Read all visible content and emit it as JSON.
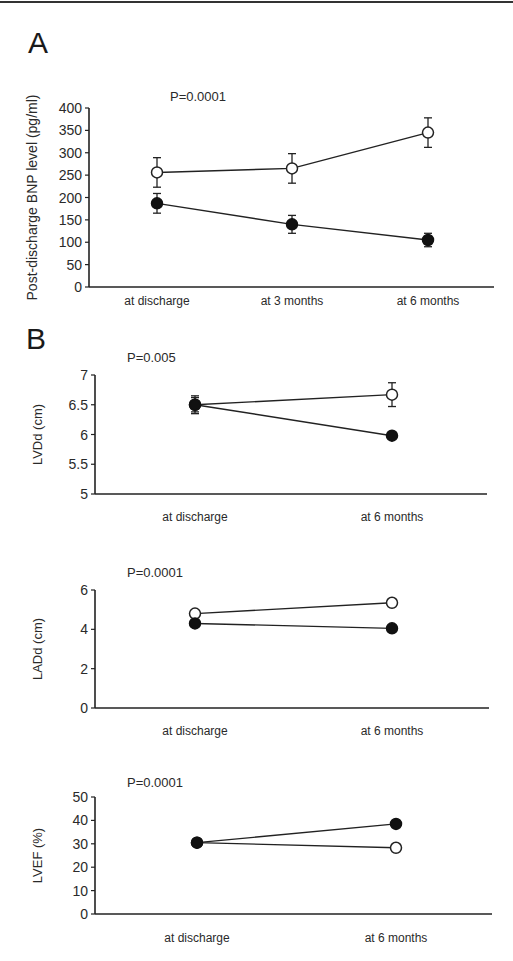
{
  "panels": {
    "A": {
      "letter": "A"
    },
    "B": {
      "letter": "B"
    }
  },
  "series_styles": {
    "open": {
      "fill": "#ffffff",
      "stroke": "#222222"
    },
    "filled": {
      "fill": "#111111",
      "stroke": "#111111"
    }
  },
  "chart_data": [
    {
      "type": "line",
      "panel": "A",
      "title": "P=0.0001",
      "xlabel": "",
      "ylabel": "Post-discharge BNP level (pg/ml)",
      "categories": [
        "at discharge",
        "at 3 months",
        "at 6 months"
      ],
      "yticks": [
        0,
        50,
        100,
        150,
        200,
        250,
        300,
        350,
        400
      ],
      "ylim": [
        0,
        400
      ],
      "grid": false,
      "series": [
        {
          "name": "open circles",
          "marker": "open",
          "values": [
            256,
            265,
            345
          ],
          "errors": [
            33,
            33,
            33
          ]
        },
        {
          "name": "filled circles",
          "marker": "filled",
          "values": [
            187,
            140,
            105
          ],
          "errors": [
            22,
            20,
            15
          ]
        }
      ],
      "frame": {
        "x0": 89,
        "x1": 494,
        "y_top": 108,
        "y_bottom": 287,
        "xs": [
          157,
          292,
          428
        ],
        "label_y": 305,
        "title_x": 170,
        "title_y": 101
      }
    },
    {
      "type": "line",
      "panel": "B",
      "title": "P=0.005",
      "xlabel": "",
      "ylabel": "LVDd (cm)",
      "categories": [
        "at discharge",
        "at 6 months"
      ],
      "yticks": [
        5,
        5.5,
        6,
        6.5,
        7
      ],
      "ylim": [
        5,
        7
      ],
      "grid": false,
      "series": [
        {
          "name": "open circles",
          "marker": "open",
          "values": [
            6.5,
            6.67
          ],
          "errors": [
            0.15,
            0.2
          ]
        },
        {
          "name": "filled circles",
          "marker": "filled",
          "values": [
            6.5,
            5.98
          ],
          "errors": [
            0.12,
            0.05
          ]
        }
      ],
      "frame": {
        "x0": 95,
        "x1": 487,
        "y_top": 375,
        "y_bottom": 494,
        "xs": [
          195,
          392
        ],
        "label_y": 521,
        "title_x": 127,
        "title_y": 362
      }
    },
    {
      "type": "line",
      "panel": "B",
      "title": "P=0.0001",
      "xlabel": "",
      "ylabel": "LADd (cm)",
      "categories": [
        "at discharge",
        "at 6 months"
      ],
      "yticks": [
        0,
        2,
        4,
        6
      ],
      "ylim": [
        0,
        6
      ],
      "grid": false,
      "series": [
        {
          "name": "open circles",
          "marker": "open",
          "values": [
            4.8,
            5.35
          ],
          "errors": [
            0,
            0
          ]
        },
        {
          "name": "filled circles",
          "marker": "filled",
          "values": [
            4.3,
            4.05
          ],
          "errors": [
            0,
            0
          ]
        }
      ],
      "frame": {
        "x0": 95,
        "x1": 489,
        "y_top": 590,
        "y_bottom": 708,
        "xs": [
          195,
          392
        ],
        "label_y": 735,
        "title_x": 127,
        "title_y": 577
      }
    },
    {
      "type": "line",
      "panel": "B",
      "title": "P=0.0001",
      "xlabel": "",
      "ylabel": "LVEF (%)",
      "categories": [
        "at discharge",
        "at 6 months"
      ],
      "yticks": [
        0,
        10,
        20,
        30,
        40,
        50
      ],
      "ylim": [
        0,
        50
      ],
      "grid": false,
      "series": [
        {
          "name": "open circles",
          "marker": "open",
          "values": [
            30.5,
            28.3
          ],
          "errors": [
            0,
            0
          ]
        },
        {
          "name": "filled circles",
          "marker": "filled",
          "values": [
            30.5,
            38.5
          ],
          "errors": [
            0,
            0
          ]
        }
      ],
      "frame": {
        "x0": 95,
        "x1": 492,
        "y_top": 797,
        "y_bottom": 914,
        "xs": [
          197,
          396
        ],
        "label_y": 942,
        "title_x": 127,
        "title_y": 787
      }
    }
  ]
}
